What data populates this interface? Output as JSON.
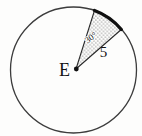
{
  "diagram": {
    "center_label": "E",
    "angle_label": "30°",
    "radius_label": "5",
    "colors": {
      "background": "#fdfdfc",
      "circle_outline": "#3c3c3c",
      "sector_edge": "#2b2b2b",
      "bold_arc": "#101010",
      "center_dot": "#111111",
      "stipple_dot": "#1a1a1a"
    }
  }
}
